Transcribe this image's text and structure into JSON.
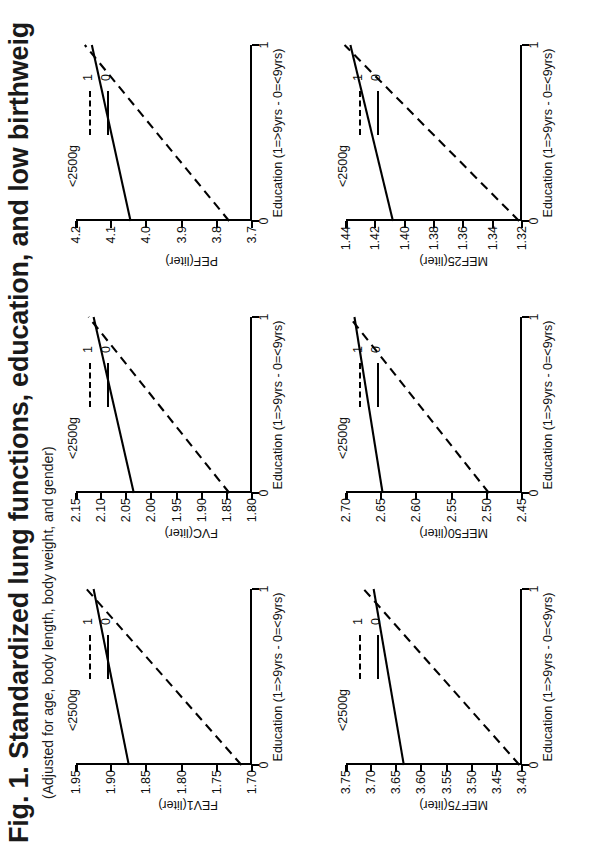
{
  "title": "Fig. 1. Standardized lung functions, education, and low birthweig",
  "subtitle": "(Adjusted for age, body length, body weight, and gender)",
  "legend": {
    "title": "<2500g",
    "entries": [
      {
        "label": "1",
        "style": "dashed"
      },
      {
        "label": "0",
        "style": "solid"
      }
    ]
  },
  "common": {
    "xlabel": "Education (1=>9yrs - 0=<9yrs)",
    "xticks": [
      "0",
      "1"
    ]
  },
  "chart_data": [
    {
      "type": "line",
      "name": "FEV1",
      "title": "",
      "xlabel": "Education (1=>9yrs - 0=<9yrs)",
      "ylabel": "FEV1(liter)",
      "x": [
        0,
        1
      ],
      "xticklabels": [
        "0",
        "1"
      ],
      "xlim": [
        0,
        1
      ],
      "ylim": [
        1.7,
        1.95
      ],
      "yticklabels": [
        "1.70",
        "1.75",
        "1.80",
        "1.85",
        "1.90",
        "1.95"
      ],
      "yticks": [
        1.7,
        1.75,
        1.8,
        1.85,
        1.9,
        1.95
      ],
      "grid": false,
      "series": [
        {
          "name": "0",
          "style": "solid",
          "values": [
            1.875,
            1.925
          ]
        },
        {
          "name": "1",
          "style": "dashed",
          "values": [
            1.715,
            1.935
          ]
        }
      ]
    },
    {
      "type": "line",
      "name": "FVC",
      "title": "",
      "xlabel": "Education (1=>9yrs - 0=<9yrs)",
      "ylabel": "FVC(liter)",
      "x": [
        0,
        1
      ],
      "xticklabels": [
        "0",
        "1"
      ],
      "xlim": [
        0,
        1
      ],
      "ylim": [
        1.8,
        2.15
      ],
      "yticklabels": [
        "1.80",
        "1.85",
        "1.90",
        "1.95",
        "2.00",
        "2.05",
        "2.10",
        "2.15"
      ],
      "yticks": [
        1.8,
        1.85,
        1.9,
        1.95,
        2.0,
        2.05,
        2.1,
        2.15
      ],
      "grid": false,
      "series": [
        {
          "name": "0",
          "style": "solid",
          "values": [
            2.035,
            2.115
          ]
        },
        {
          "name": "1",
          "style": "dashed",
          "values": [
            1.845,
            2.125
          ]
        }
      ]
    },
    {
      "type": "line",
      "name": "PEF",
      "title": "",
      "xlabel": "Education (1=>9yrs - 0=<9yrs)",
      "ylabel": "PEF(liter)",
      "x": [
        0,
        1
      ],
      "xticklabels": [
        "0",
        "1"
      ],
      "xlim": [
        0,
        1
      ],
      "ylim": [
        3.7,
        4.2
      ],
      "yticklabels": [
        "3.7",
        "3.8",
        "3.9",
        "4.0",
        "4.1",
        "4.2"
      ],
      "yticks": [
        3.7,
        3.8,
        3.9,
        4.0,
        4.1,
        4.2
      ],
      "grid": false,
      "series": [
        {
          "name": "0",
          "style": "solid",
          "values": [
            4.045,
            4.155
          ]
        },
        {
          "name": "1",
          "style": "dashed",
          "values": [
            3.765,
            4.175
          ]
        }
      ]
    },
    {
      "type": "line",
      "name": "MEF75",
      "title": "",
      "xlabel": "Education (1=>9yrs - 0=<9yrs)",
      "ylabel": "MEF75(liter)",
      "x": [
        0,
        1
      ],
      "xticklabels": [
        "0",
        "1"
      ],
      "xlim": [
        0,
        1
      ],
      "ylim": [
        3.4,
        3.75
      ],
      "yticklabels": [
        "3.40",
        "3.45",
        "3.50",
        "3.55",
        "3.60",
        "3.65",
        "3.70",
        "3.75"
      ],
      "yticks": [
        3.4,
        3.45,
        3.5,
        3.55,
        3.6,
        3.65,
        3.7,
        3.75
      ],
      "grid": false,
      "series": [
        {
          "name": "0",
          "style": "solid",
          "values": [
            3.635,
            3.695
          ]
        },
        {
          "name": "1",
          "style": "dashed",
          "values": [
            3.405,
            3.715
          ]
        }
      ]
    },
    {
      "type": "line",
      "name": "MEF50",
      "title": "",
      "xlabel": "Education (1=>9yrs - 0=<9yrs)",
      "ylabel": "MEF50(liter)",
      "x": [
        0,
        1
      ],
      "xticklabels": [
        "0",
        "1"
      ],
      "xlim": [
        0,
        1
      ],
      "ylim": [
        2.45,
        2.7
      ],
      "yticklabels": [
        "2.45",
        "2.50",
        "2.55",
        "2.60",
        "2.65",
        "2.70"
      ],
      "yticks": [
        2.45,
        2.5,
        2.55,
        2.6,
        2.65,
        2.7
      ],
      "grid": false,
      "series": [
        {
          "name": "0",
          "style": "solid",
          "values": [
            2.648,
            2.688
          ]
        },
        {
          "name": "1",
          "style": "dashed",
          "values": [
            2.497,
            2.695
          ]
        }
      ]
    },
    {
      "type": "line",
      "name": "MEF25",
      "title": "",
      "xlabel": "Education (1=>9yrs - 0=<9yrs)",
      "ylabel": "MEF25(liter)",
      "x": [
        0,
        1
      ],
      "xticklabels": [
        "0",
        "1"
      ],
      "xlim": [
        0,
        1
      ],
      "ylim": [
        1.32,
        1.44
      ],
      "yticklabels": [
        "1.32",
        "1.34",
        "1.36",
        "1.38",
        "1.40",
        "1.42",
        "1.44"
      ],
      "yticks": [
        1.32,
        1.34,
        1.36,
        1.38,
        1.4,
        1.42,
        1.44
      ],
      "grid": false,
      "series": [
        {
          "name": "0",
          "style": "solid",
          "values": [
            1.408,
            1.437
          ]
        },
        {
          "name": "1",
          "style": "dashed",
          "values": [
            1.322,
            1.441
          ]
        }
      ]
    }
  ]
}
